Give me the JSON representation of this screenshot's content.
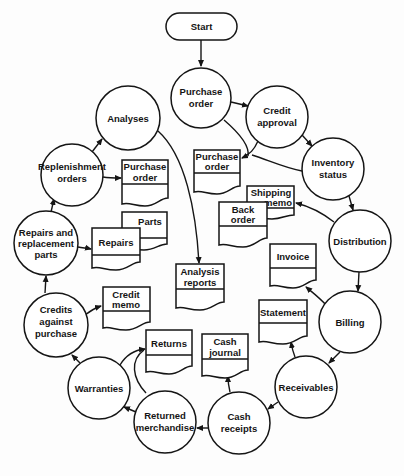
{
  "diagram": {
    "type": "system flowchart",
    "start": {
      "label": "Start"
    },
    "processes": [
      {
        "id": "purchase-order",
        "lines": [
          "Purchase",
          "order"
        ]
      },
      {
        "id": "credit-approval",
        "lines": [
          "Credit",
          "approval"
        ]
      },
      {
        "id": "inventory-status",
        "lines": [
          "Inventory",
          "status"
        ]
      },
      {
        "id": "distribution",
        "lines": [
          "Distribution"
        ]
      },
      {
        "id": "billing",
        "lines": [
          "Billing"
        ]
      },
      {
        "id": "receivables",
        "lines": [
          "Receivables"
        ]
      },
      {
        "id": "cash-receipts",
        "lines": [
          "Cash",
          "receipts"
        ]
      },
      {
        "id": "returned-merchandise",
        "lines": [
          "Returned",
          "merchandise"
        ]
      },
      {
        "id": "warranties",
        "lines": [
          "Warranties"
        ]
      },
      {
        "id": "credits-against-purchase",
        "lines": [
          "Credits",
          "against",
          "purchase"
        ]
      },
      {
        "id": "repairs-replacement-parts",
        "lines": [
          "Repairs and",
          "replacement",
          "parts"
        ]
      },
      {
        "id": "replenishment-orders",
        "lines": [
          "Replenishment",
          "orders"
        ]
      },
      {
        "id": "analyses",
        "lines": [
          "Analyses"
        ]
      }
    ],
    "documents": [
      {
        "id": "doc-purchase-order-right",
        "lines": [
          "Purchase",
          "order"
        ]
      },
      {
        "id": "doc-shipping-memo",
        "lines": [
          "Shipping",
          "memo"
        ]
      },
      {
        "id": "doc-back-order",
        "lines": [
          "Back",
          "order"
        ]
      },
      {
        "id": "doc-invoice",
        "lines": [
          "Invoice"
        ]
      },
      {
        "id": "doc-statement",
        "lines": [
          "Statement"
        ]
      },
      {
        "id": "doc-cash-journal",
        "lines": [
          "Cash",
          "journal"
        ]
      },
      {
        "id": "doc-returns",
        "lines": [
          "Returns"
        ]
      },
      {
        "id": "doc-credit-memo",
        "lines": [
          "Credit",
          "memo"
        ]
      },
      {
        "id": "doc-parts",
        "lines": [
          "Parts"
        ]
      },
      {
        "id": "doc-repairs",
        "lines": [
          "Repairs"
        ]
      },
      {
        "id": "doc-purchase-order-left",
        "lines": [
          "Purchase",
          "order"
        ]
      },
      {
        "id": "doc-analysis-reports",
        "lines": [
          "Analysis",
          "reports"
        ]
      }
    ],
    "flows": [
      [
        "Start",
        "Purchase order"
      ],
      [
        "Purchase order",
        "Credit approval"
      ],
      [
        "Credit approval",
        "Inventory status"
      ],
      [
        "Inventory status",
        "Distribution"
      ],
      [
        "Distribution",
        "Billing"
      ],
      [
        "Billing",
        "Receivables"
      ],
      [
        "Receivables",
        "Cash receipts"
      ],
      [
        "Cash receipts",
        "Returned merchandise"
      ],
      [
        "Returned merchandise",
        "Warranties"
      ],
      [
        "Warranties",
        "Credits against purchase"
      ],
      [
        "Credits against purchase",
        "Repairs and replacement parts"
      ],
      [
        "Repairs and replacement parts",
        "Replenishment orders"
      ],
      [
        "Replenishment orders",
        "Analyses"
      ],
      [
        "Purchase order / Credit approval / Inventory status",
        "Purchase order (doc)"
      ],
      [
        "Distribution",
        "Shipping memo / Back order"
      ],
      [
        "Billing",
        "Invoice"
      ],
      [
        "Receivables",
        "Statement"
      ],
      [
        "Cash receipts",
        "Cash journal"
      ],
      [
        "Warranties / Returned merchandise",
        "Returns"
      ],
      [
        "Credits against purchase",
        "Credit memo"
      ],
      [
        "Repairs and replacement parts",
        "Repairs / Parts"
      ],
      [
        "Replenishment orders",
        "Purchase order (doc)"
      ],
      [
        "Analyses",
        "Analysis reports"
      ]
    ]
  }
}
